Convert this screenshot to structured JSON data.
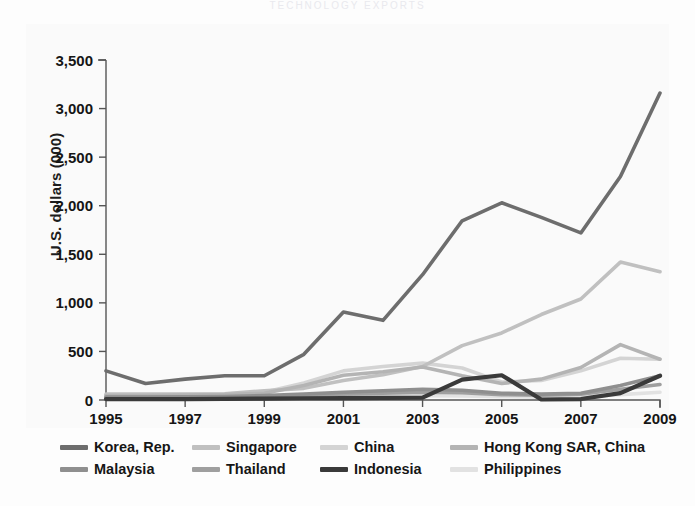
{
  "figure": {
    "clipped_header": "TECHNOLOGY  EXPORTS",
    "ylabel": "U.S. dollars (000)"
  },
  "chart_data": {
    "type": "line",
    "title": "",
    "xlabel": "",
    "ylabel": "U.S. dollars (000)",
    "x": [
      1995,
      1996,
      1997,
      1998,
      1999,
      2000,
      2001,
      2002,
      2003,
      2004,
      2005,
      2006,
      2007,
      2008,
      2009
    ],
    "xtick_labels": [
      "1995",
      "1997",
      "1999",
      "2001",
      "2003",
      "2005",
      "2007",
      "2009"
    ],
    "xtick_values": [
      1995,
      1997,
      1999,
      2001,
      2003,
      2005,
      2007,
      2009
    ],
    "ytick_labels": [
      "0",
      "500",
      "1,000",
      "1,500",
      "2,000",
      "2,500",
      "3,000",
      "3,500"
    ],
    "ytick_values": [
      0,
      500,
      1000,
      1500,
      2000,
      2500,
      3000,
      3500
    ],
    "xlim": [
      1995,
      2009
    ],
    "ylim": [
      0,
      3500
    ],
    "grid": false,
    "legend_position": "below",
    "series": [
      {
        "name": "Korea, Rep.",
        "color": "#6d6d6d",
        "width": 3.6,
        "values": [
          300,
          170,
          215,
          250,
          250,
          470,
          905,
          820,
          1290,
          1845,
          2030,
          1880,
          1720,
          2300,
          3160
        ]
      },
      {
        "name": "Singapore",
        "color": "#c0c0c0",
        "width": 3.6,
        "values": [
          60,
          60,
          60,
          65,
          95,
          120,
          200,
          260,
          345,
          560,
          690,
          880,
          1040,
          1420,
          1320
        ]
      },
      {
        "name": "China",
        "color": "#d4d4d4",
        "width": 3.6,
        "values": [
          50,
          50,
          55,
          60,
          80,
          175,
          300,
          345,
          380,
          330,
          185,
          200,
          300,
          430,
          420
        ]
      },
      {
        "name": "Hong Kong SAR, China",
        "color": "#b4b4b4",
        "width": 3.6,
        "values": [
          45,
          45,
          50,
          55,
          70,
          150,
          255,
          290,
          340,
          250,
          170,
          215,
          335,
          570,
          420
        ]
      },
      {
        "name": "Malaysia",
        "color": "#8f8f8f",
        "width": 3.6,
        "values": [
          30,
          30,
          32,
          35,
          45,
          60,
          80,
          95,
          110,
          100,
          70,
          60,
          70,
          150,
          250
        ]
      },
      {
        "name": "Thailand",
        "color": "#9f9f9f",
        "width": 3.6,
        "values": [
          25,
          25,
          26,
          28,
          35,
          45,
          60,
          70,
          80,
          75,
          55,
          50,
          60,
          110,
          160
        ]
      },
      {
        "name": "Indonesia",
        "color": "#3a3a3a",
        "width": 4.2,
        "values": [
          10,
          10,
          10,
          12,
          15,
          18,
          20,
          22,
          25,
          210,
          255,
          5,
          10,
          70,
          250
        ]
      },
      {
        "name": "Philippines",
        "color": "#e2e2e2",
        "width": 3.6,
        "values": [
          15,
          15,
          16,
          18,
          22,
          28,
          35,
          40,
          45,
          42,
          35,
          30,
          35,
          55,
          80
        ]
      }
    ]
  },
  "legend": {
    "rows": [
      [
        {
          "label": "Korea, Rep.",
          "color": "#6d6d6d"
        },
        {
          "label": "Singapore",
          "color": "#c0c0c0"
        },
        {
          "label": "China",
          "color": "#d4d4d4"
        },
        {
          "label": "Hong Kong SAR, China",
          "color": "#b4b4b4"
        }
      ],
      [
        {
          "label": "Malaysia",
          "color": "#8f8f8f"
        },
        {
          "label": "Thailand",
          "color": "#9f9f9f"
        },
        {
          "label": "Indonesia",
          "color": "#3a3a3a"
        },
        {
          "label": "Philippines",
          "color": "#e2e2e2"
        }
      ]
    ]
  }
}
